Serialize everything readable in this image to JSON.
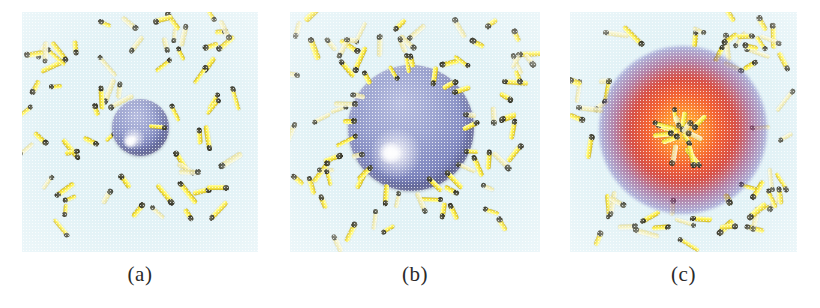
{
  "figure": {
    "type": "simulation-snapshot-series",
    "background_color": "#ffffff",
    "panel_background_color": "#e2f2f6",
    "rod_color": "#f5e54a",
    "rod_head_color": "#2b2b20",
    "droplet_color": "#8e96c8",
    "micelle_core_color": "#f4581f",
    "micelle_halo_color": "#7f8fd0"
  },
  "panels": [
    {
      "id": "panel-a",
      "caption": "(a)",
      "x": 22,
      "y": 12,
      "width": 236,
      "height": 240,
      "center_object": {
        "kind": "droplet",
        "cx": 140,
        "cy": 127,
        "diameter": 57,
        "highlight_cx": 130,
        "highlight_cy": 143,
        "highlight_d": 16
      },
      "rod_count": 64,
      "adsorbed_rod_count": 1
    },
    {
      "id": "panel-b",
      "caption": "(b)",
      "x": 290,
      "y": 12,
      "width": 250,
      "height": 240,
      "center_object": {
        "kind": "droplet",
        "cx": 411,
        "cy": 128,
        "diameter": 126,
        "highlight_cx": 390,
        "highlight_cy": 155,
        "highlight_d": 26
      },
      "rod_count": 58,
      "adsorbed_rod_count": 22
    },
    {
      "id": "panel-c",
      "caption": "(c)",
      "x": 570,
      "y": 12,
      "width": 227,
      "height": 240,
      "center_object": {
        "kind": "micelle",
        "cx": 683,
        "cy": 130,
        "glow_diameter": 168,
        "core_diameter": 96,
        "cluster_diameter": 50
      },
      "rod_count": 56,
      "adsorbed_rod_count": 14
    }
  ],
  "captions": {
    "a": "(a)",
    "b": "(b)",
    "c": "(c)"
  }
}
